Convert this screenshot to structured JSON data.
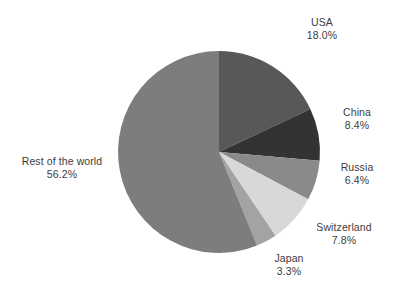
{
  "chart_data": {
    "type": "pie",
    "title": "",
    "subtitle": "",
    "xlabel": "",
    "ylabel": "",
    "legend_position": "none",
    "grid": false,
    "labels_outside": true,
    "start_angle_deg": 0,
    "direction": "clockwise",
    "categories": [
      "USA",
      "China",
      "Russia",
      "Switzerland",
      "Japan",
      "Rest of the world"
    ],
    "values": [
      18.0,
      8.4,
      6.4,
      7.8,
      3.3,
      56.2
    ],
    "value_suffix": "%",
    "slices": [
      {
        "name": "USA",
        "value": 18.0,
        "value_text": "18.0%",
        "color": "#585858"
      },
      {
        "name": "China",
        "value": 8.4,
        "value_text": "8.4%",
        "color": "#333333"
      },
      {
        "name": "Russia",
        "value": 6.4,
        "value_text": "6.4%",
        "color": "#8a8a8a"
      },
      {
        "name": "Switzerland",
        "value": 7.8,
        "value_text": "7.8%",
        "color": "#d8d8d8"
      },
      {
        "name": "Japan",
        "value": 3.3,
        "value_text": "3.3%",
        "color": "#a3a3a3"
      },
      {
        "name": "Rest of the world",
        "value": 56.2,
        "value_text": "56.2%",
        "color": "#7d7d7d"
      }
    ]
  },
  "labels": {
    "usa": {
      "name": "USA",
      "value": "18.0%"
    },
    "china": {
      "name": "China",
      "value": "8.4%"
    },
    "russia": {
      "name": "Russia",
      "value": "6.4%"
    },
    "switzerland": {
      "name": "Switzerland",
      "value": "7.8%"
    },
    "japan": {
      "name": "Japan",
      "value": "3.3%"
    },
    "rest": {
      "name": "Rest of the world",
      "value": "56.2%"
    }
  },
  "colors": {
    "background": "#ffffff",
    "text": "#3d3d3d",
    "usa": "#585858",
    "china": "#333333",
    "russia": "#8a8a8a",
    "switzerland": "#d8d8d8",
    "japan": "#a3a3a3",
    "rest": "#7d7d7d"
  }
}
